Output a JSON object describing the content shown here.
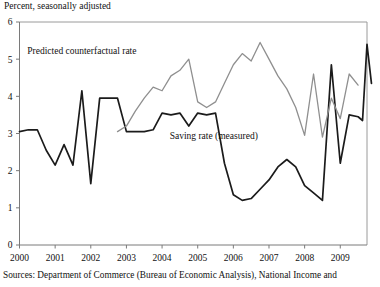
{
  "figure": {
    "axis_note": "Percent, seasonally adjusted",
    "source_note": "Sources:  Department of Commerce (Bureau of Economic Analysis), National Income and"
  },
  "chart_data": {
    "type": "line",
    "title": "",
    "subtitle": "",
    "xlabel": "",
    "ylabel": "Percent, seasonally adjusted",
    "xlim": [
      2000.0,
      2009.75
    ],
    "ylim": [
      0,
      6
    ],
    "yticks": [
      0,
      1,
      2,
      3,
      4,
      5,
      6
    ],
    "ytick_labels": [
      "0",
      "1",
      "2",
      "3",
      "4",
      "5",
      "6"
    ],
    "xticks": [
      2000,
      2001,
      2002,
      2003,
      2004,
      2005,
      2006,
      2007,
      2008,
      2009
    ],
    "xtick_labels": [
      "2000",
      "2001",
      "2002",
      "2003",
      "2004",
      "2005",
      "2006",
      "2007",
      "2008",
      "2009"
    ],
    "grid": false,
    "legend": "inline-annotations",
    "annotations": [
      {
        "text": "Predicted counterfactual rate",
        "x": 2001.75,
        "y": 5.15,
        "color": "#111111"
      },
      {
        "text": "Saving rate (measured)",
        "x": 2005.45,
        "y": 2.85,
        "color": "#111111"
      }
    ],
    "series": [
      {
        "name": "Saving rate (measured)",
        "color": "#1b1b1b",
        "x": [
          2000.0,
          2000.25,
          2000.5,
          2000.75,
          2001.0,
          2001.25,
          2001.5,
          2001.75,
          2002.0,
          2002.25,
          2002.5,
          2002.75,
          2003.0,
          2003.25,
          2003.5,
          2003.75,
          2004.0,
          2004.25,
          2004.5,
          2004.75,
          2005.0,
          2005.25,
          2005.5,
          2005.75,
          2006.0,
          2006.25,
          2006.5,
          2006.75,
          2007.0,
          2007.25,
          2007.5,
          2007.75,
          2008.0,
          2008.25,
          2008.5,
          2008.75,
          2009.0,
          2009.25,
          2009.5
        ],
        "y": [
          3.05,
          3.1,
          3.1,
          2.55,
          2.15,
          2.7,
          2.15,
          4.15,
          1.65,
          3.95,
          3.95,
          3.95,
          3.05,
          3.05,
          3.05,
          3.1,
          3.55,
          3.5,
          3.55,
          3.2,
          3.55,
          3.5,
          3.55,
          2.2,
          1.35,
          1.2,
          1.25,
          1.5,
          1.75,
          2.1,
          2.3,
          2.1,
          1.6,
          1.4,
          1.2,
          4.85,
          2.2,
          3.5,
          3.45
        ],
        "y_tail": [
          3.35,
          5.4,
          4.35
        ]
      },
      {
        "name": "Predicted counterfactual rate",
        "color": "#8f8f8f",
        "x": [
          2002.75,
          2003.0,
          2003.25,
          2003.5,
          2003.75,
          2004.0,
          2004.25,
          2004.5,
          2004.75,
          2005.0,
          2005.25,
          2005.5,
          2005.75,
          2006.0,
          2006.25,
          2006.5,
          2006.75,
          2007.0,
          2007.25,
          2007.5,
          2007.75,
          2008.0,
          2008.25,
          2008.5,
          2008.75,
          2009.0,
          2009.25,
          2009.5
        ],
        "y": [
          3.05,
          3.2,
          3.6,
          3.95,
          4.25,
          4.15,
          4.55,
          4.7,
          5.0,
          3.85,
          3.7,
          3.85,
          4.35,
          4.85,
          5.15,
          4.95,
          5.45,
          5.0,
          4.55,
          4.2,
          3.7,
          2.95,
          4.6,
          2.9,
          3.95,
          3.4,
          4.6,
          4.3
        ]
      }
    ]
  },
  "geometry": {
    "plot_left": 19.5,
    "plot_right": 367,
    "plot_top": 22,
    "plot_bottom": 245,
    "x_min": 2000.0,
    "x_max": 2009.75,
    "y_min": 0,
    "y_max": 6
  }
}
